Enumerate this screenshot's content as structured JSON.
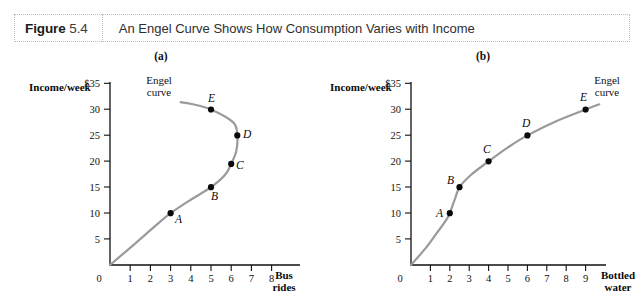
{
  "header": {
    "figure_word": "Figure",
    "figure_number": "5.4",
    "title": "An Engel Curve Shows How Consumption Varies with Income"
  },
  "panels": [
    {
      "caption": "(a)",
      "y_axis_title": "Income/week",
      "x_axis_title_line1": "Bus",
      "x_axis_title_line2": "rides",
      "curve_note_line1": "Engel",
      "curve_note_line2": "curve",
      "origin_label": "0",
      "y_ticks": [
        "$35",
        "30",
        "25",
        "20",
        "15",
        "10",
        "5"
      ],
      "x_ticks": [
        "1",
        "2",
        "3",
        "4",
        "5",
        "6",
        "7",
        "8"
      ],
      "point_labels": [
        "A",
        "B",
        "C",
        "D",
        "E"
      ]
    },
    {
      "caption": "(b)",
      "y_axis_title": "Income/week",
      "x_axis_title_line1": "Bottled",
      "x_axis_title_line2": "water",
      "curve_note_line1": "Engel",
      "curve_note_line2": "curve",
      "origin_label": "0",
      "y_ticks": [
        "$35",
        "30",
        "25",
        "20",
        "15",
        "10",
        "5"
      ],
      "x_ticks": [
        "1",
        "2",
        "3",
        "4",
        "5",
        "6",
        "7",
        "8",
        "9"
      ],
      "point_labels": [
        "A",
        "B",
        "C",
        "D",
        "E"
      ]
    }
  ],
  "colors": {
    "curve": "#9a9a9a",
    "axis": "#111111",
    "point": "#0a0a0a",
    "header_border": "#b9c3cc"
  },
  "chart_data": [
    {
      "type": "line",
      "title": "(a) Engel curve for bus rides (inferior good beyond point D)",
      "xlabel": "Bus rides",
      "ylabel": "Income/week",
      "xlim": [
        0,
        8.8
      ],
      "ylim": [
        0,
        36
      ],
      "grid": false,
      "legend": "none",
      "x_ticks": [
        1,
        2,
        3,
        4,
        5,
        6,
        7,
        8
      ],
      "y_ticks": [
        5,
        10,
        15,
        20,
        25,
        30,
        35
      ],
      "y_tick_labels": [
        "5",
        "10",
        "15",
        "20",
        "25",
        "30",
        "$35"
      ],
      "annotations": [
        "Engel curve"
      ],
      "points": [
        {
          "label": "A",
          "x": 3.0,
          "y": 10
        },
        {
          "label": "B",
          "x": 5.0,
          "y": 15
        },
        {
          "label": "C",
          "x": 6.0,
          "y": 19.5
        },
        {
          "label": "D",
          "x": 6.3,
          "y": 25
        },
        {
          "label": "E",
          "x": 5.0,
          "y": 30
        }
      ],
      "curve_path": [
        {
          "x": 0.0,
          "y": 0
        },
        {
          "x": 1.2,
          "y": 4.0
        },
        {
          "x": 2.2,
          "y": 7.4
        },
        {
          "x": 3.0,
          "y": 10
        },
        {
          "x": 4.0,
          "y": 12.6
        },
        {
          "x": 5.0,
          "y": 15
        },
        {
          "x": 5.7,
          "y": 17.4
        },
        {
          "x": 6.0,
          "y": 19.5
        },
        {
          "x": 6.25,
          "y": 22.0
        },
        {
          "x": 6.3,
          "y": 25
        },
        {
          "x": 6.1,
          "y": 27.5
        },
        {
          "x": 5.0,
          "y": 30
        },
        {
          "x": 4.1,
          "y": 31.0
        },
        {
          "x": 3.5,
          "y": 31.4
        }
      ]
    },
    {
      "type": "line",
      "title": "(b) Engel curve for bottled water (normal good)",
      "xlabel": "Bottled water",
      "ylabel": "Income/week",
      "xlim": [
        0,
        9.8
      ],
      "ylim": [
        0,
        36
      ],
      "grid": false,
      "legend": "none",
      "x_ticks": [
        1,
        2,
        3,
        4,
        5,
        6,
        7,
        8,
        9
      ],
      "y_ticks": [
        5,
        10,
        15,
        20,
        25,
        30,
        35
      ],
      "y_tick_labels": [
        "5",
        "10",
        "15",
        "20",
        "25",
        "30",
        "$35"
      ],
      "annotations": [
        "Engel curve"
      ],
      "points": [
        {
          "label": "A",
          "x": 2.0,
          "y": 10
        },
        {
          "label": "B",
          "x": 2.5,
          "y": 15
        },
        {
          "label": "C",
          "x": 4.0,
          "y": 20
        },
        {
          "label": "D",
          "x": 6.0,
          "y": 25
        },
        {
          "label": "E",
          "x": 9.0,
          "y": 30
        }
      ],
      "curve_path": [
        {
          "x": 0.0,
          "y": 0
        },
        {
          "x": 0.7,
          "y": 3.0
        },
        {
          "x": 1.3,
          "y": 6.0
        },
        {
          "x": 1.8,
          "y": 8.6
        },
        {
          "x": 2.0,
          "y": 10
        },
        {
          "x": 2.25,
          "y": 12.6
        },
        {
          "x": 2.5,
          "y": 15
        },
        {
          "x": 3.1,
          "y": 17.4
        },
        {
          "x": 4.0,
          "y": 20
        },
        {
          "x": 5.0,
          "y": 22.7
        },
        {
          "x": 6.0,
          "y": 25
        },
        {
          "x": 7.4,
          "y": 27.6
        },
        {
          "x": 9.0,
          "y": 30
        },
        {
          "x": 9.7,
          "y": 31.0
        }
      ]
    }
  ]
}
